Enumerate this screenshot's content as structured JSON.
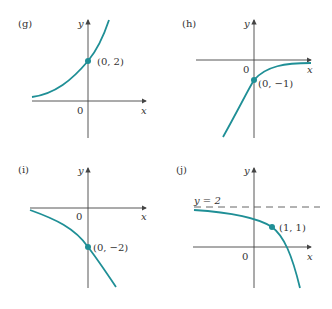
{
  "colors": {
    "curve": "#1f8f96",
    "axis": "#444444",
    "text": "#333333"
  },
  "panels": [
    {
      "id": "g",
      "label": "(g)",
      "x_label": "x",
      "y_label": "y",
      "origin_label": "0",
      "point_label": "(0, 2)",
      "point": [
        0,
        2
      ],
      "shape": "increasing exponential, asymptote y=0 to the left"
    },
    {
      "id": "h",
      "label": "(h)",
      "x_label": "x",
      "y_label": "y",
      "origin_label": "0",
      "point_label": "(0, −1)",
      "point": [
        0,
        -1
      ],
      "shape": "increasing curve from below, asymptote y=0 to the right"
    },
    {
      "id": "i",
      "label": "(i)",
      "x_label": "x",
      "y_label": "y",
      "origin_label": "0",
      "point_label": "(0, −2)",
      "point": [
        0,
        -2
      ],
      "shape": "decreasing curve, asymptote y=0 to the left"
    },
    {
      "id": "j",
      "label": "(j)",
      "x_label": "x",
      "y_label": "y",
      "origin_label": "0",
      "point_label": "(1, 1)",
      "point": [
        1,
        1
      ],
      "asymptote_label": "y = 2",
      "shape": "decreasing curve, horizontal asymptote y=2 to the left"
    }
  ]
}
